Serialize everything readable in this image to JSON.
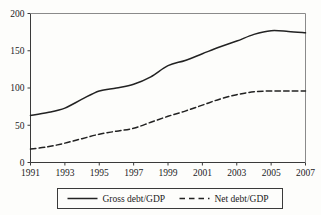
{
  "chart_data": {
    "type": "line",
    "title": "",
    "subtitle": "",
    "xlabel": "",
    "ylabel": "",
    "xlim": [
      1991,
      2007
    ],
    "ylim": [
      0,
      200
    ],
    "grid": false,
    "legend_position": "bottom-outside",
    "x": [
      1991,
      1992,
      1993,
      1994,
      1995,
      1996,
      1997,
      1998,
      1999,
      2000,
      2001,
      2002,
      2003,
      2004,
      2005,
      2006,
      2007
    ],
    "x_tick_labels": [
      "1991",
      "1993",
      "1995",
      "1997",
      "1999",
      "2001",
      "2003",
      "2005",
      "2007"
    ],
    "x_tick_values": [
      1991,
      1993,
      1995,
      1997,
      1999,
      2001,
      2003,
      2005,
      2007
    ],
    "y_tick_labels": [
      "0",
      "50",
      "100",
      "150",
      "200"
    ],
    "y_tick_values": [
      0,
      50,
      100,
      150,
      200
    ],
    "series": [
      {
        "name": "Gross debt/GDP",
        "style": "solid",
        "color": "#222222",
        "values": [
          63,
          67,
          73,
          85,
          96,
          100,
          105,
          115,
          130,
          137,
          146,
          155,
          163,
          172,
          177,
          176,
          174
        ]
      },
      {
        "name": "Net debt/GDP",
        "style": "dashed",
        "color": "#222222",
        "values": [
          18,
          21,
          26,
          32,
          38,
          42,
          46,
          54,
          62,
          69,
          77,
          85,
          91,
          95,
          96,
          96,
          96
        ]
      }
    ]
  },
  "legend": {
    "items": [
      {
        "label": "Gross debt/GDP",
        "style": "solid"
      },
      {
        "label": "Net debt/GDP",
        "style": "dashed"
      }
    ]
  }
}
